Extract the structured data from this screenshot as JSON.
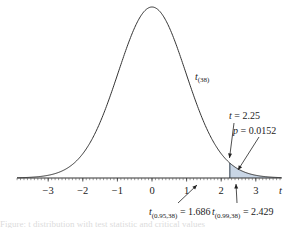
{
  "chart_data": {
    "type": "area",
    "title": "",
    "distribution": "Student's t",
    "degrees_of_freedom": 38,
    "curve_label": "t",
    "curve_label_sub": "(38)",
    "xlabel": "t",
    "ylabel": "",
    "xlim": [
      -3.9,
      3.75
    ],
    "x_ticks": [
      -3,
      -2,
      -1,
      0,
      1,
      2,
      3
    ],
    "x_tick_labels": [
      "−3",
      "−2",
      "−1",
      "0",
      "1",
      "2",
      "3"
    ],
    "minor_tick_step": 0.1,
    "grid": false,
    "shaded_region": {
      "from": 2.25,
      "to": 3.75,
      "fill": "#c9d6e6",
      "stroke": "#2b3a4a"
    },
    "annotations": [
      {
        "id": "t-stat",
        "prefix": "t",
        "sub": "",
        "text": " = 2.25",
        "points_to_x": 2.25
      },
      {
        "id": "p-value",
        "prefix": "p",
        "sub": "",
        "text": " = 0.0152",
        "points_to_x": 2.45
      },
      {
        "id": "crit-95",
        "prefix": "t",
        "sub": "(0.95,38)",
        "text": " = 1.686",
        "points_to_x": 1.686
      },
      {
        "id": "crit-99",
        "prefix": "t",
        "sub": "(0.99,38)",
        "text": " = 2.429",
        "points_to_x": 2.429
      }
    ]
  },
  "caption": "Figure: t distribution with test statistic and critical values"
}
